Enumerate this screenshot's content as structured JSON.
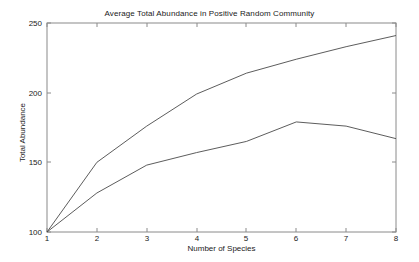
{
  "chart_data": {
    "type": "line",
    "title": "Average Total Abundance in Positive Random Community",
    "xlabel": "Number of Species",
    "ylabel": "Total Abundance",
    "x": [
      1,
      2,
      3,
      4,
      5,
      6,
      7,
      8
    ],
    "xlim": [
      1,
      8
    ],
    "ylim": [
      100,
      250
    ],
    "xticks": [
      1,
      2,
      3,
      4,
      5,
      6,
      7,
      8
    ],
    "yticks": [
      100,
      150,
      200,
      250
    ],
    "xtick_labels": [
      "1",
      "2",
      "3",
      "4",
      "5",
      "6",
      "7",
      "8"
    ],
    "ytick_labels": [
      "100",
      "150",
      "200",
      "250"
    ],
    "grid": false,
    "legend": "none",
    "line_color": "#4a4a4a",
    "axis_color": "#8a8a8a",
    "background": "#ffffff",
    "series": [
      {
        "name": "upper-curve",
        "values": [
          100,
          150,
          176,
          199,
          214,
          224,
          233,
          241
        ]
      },
      {
        "name": "lower-curve",
        "values": [
          100,
          128,
          148,
          157,
          165,
          179,
          176,
          167
        ]
      }
    ]
  },
  "figure": {
    "title": "Average Total Abundance in Positive Random Community",
    "xlabel": "Number of Species",
    "ylabel": "Total Abundance",
    "ytick_0": "100",
    "ytick_1": "150",
    "ytick_2": "200",
    "ytick_3": "250",
    "xtick_0": "1",
    "xtick_1": "2",
    "xtick_2": "3",
    "xtick_3": "4",
    "xtick_4": "5",
    "xtick_5": "6",
    "xtick_6": "7",
    "xtick_7": "8"
  }
}
